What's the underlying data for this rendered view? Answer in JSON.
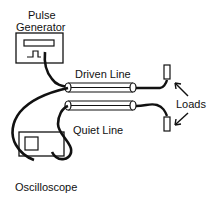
{
  "labels": {
    "pulse_generator_line1": "Pulse",
    "pulse_generator_line2": "Generator",
    "driven_line": "Driven Line",
    "quiet_line": "Quiet Line",
    "loads": "Loads",
    "oscilloscope": "Oscilloscope"
  },
  "colors": {
    "ink": "#111111",
    "background": "#ffffff"
  },
  "components": [
    {
      "name": "pulse-generator",
      "label": "Pulse Generator"
    },
    {
      "name": "driven-line",
      "label": "Driven Line"
    },
    {
      "name": "quiet-line",
      "label": "Quiet Line"
    },
    {
      "name": "load-top",
      "label": "Load"
    },
    {
      "name": "load-bottom",
      "label": "Load"
    },
    {
      "name": "oscilloscope",
      "label": "Oscilloscope"
    }
  ]
}
